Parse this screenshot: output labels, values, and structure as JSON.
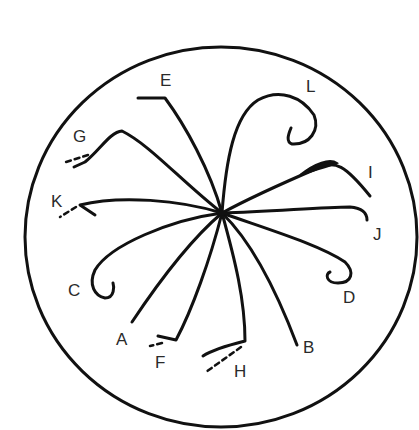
{
  "diagram": {
    "type": "radial-curve-diagram",
    "center": {
      "x": 222,
      "y": 213
    },
    "outer_circle": {
      "cx": 220,
      "cy": 237,
      "r": 190
    },
    "stroke_color": "#111111",
    "label_color": "#2a2a2a",
    "labels": [
      {
        "id": "A",
        "text": "A",
        "x": 116,
        "y": 345
      },
      {
        "id": "B",
        "text": "B",
        "x": 304,
        "y": 353
      },
      {
        "id": "C",
        "text": "C",
        "x": 68,
        "y": 296
      },
      {
        "id": "D",
        "text": "D",
        "x": 344,
        "y": 302
      },
      {
        "id": "E",
        "text": "E",
        "x": 160,
        "y": 86
      },
      {
        "id": "F",
        "text": "F",
        "x": 155,
        "y": 367
      },
      {
        "id": "G",
        "text": "G",
        "x": 73,
        "y": 141
      },
      {
        "id": "H",
        "text": "H",
        "x": 234,
        "y": 377
      },
      {
        "id": "I",
        "text": "I",
        "x": 369,
        "y": 177
      },
      {
        "id": "J",
        "text": "J",
        "x": 373,
        "y": 240
      },
      {
        "id": "K",
        "text": "K",
        "x": 51,
        "y": 206
      },
      {
        "id": "L",
        "text": "L",
        "x": 306,
        "y": 91
      }
    ]
  }
}
